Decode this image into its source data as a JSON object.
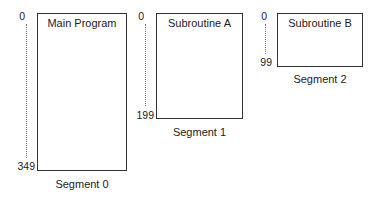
{
  "segments": [
    {
      "title": "Main Program",
      "label": "Segment 0",
      "start": "0",
      "end": "349"
    },
    {
      "title": "Subroutine A",
      "label": "Segment 1",
      "start": "0",
      "end": "199"
    },
    {
      "title": "Subroutine B",
      "label": "Segment 2",
      "start": "0",
      "end": "99"
    }
  ]
}
